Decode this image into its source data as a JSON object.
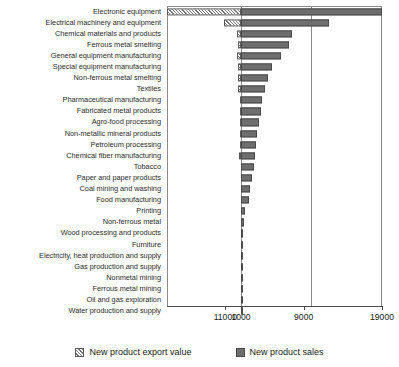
{
  "chart_data": {
    "type": "bar",
    "orientation": "horizontal",
    "title": "",
    "xlabel": "",
    "ylabel": "",
    "grid": true,
    "legend_position": "bottom",
    "axis_ticks": [
      {
        "label": "11000",
        "value": -1000
      },
      {
        "label": "1000",
        "value": 1000
      },
      {
        "label": "9000",
        "value": 9000
      },
      {
        "label": "19000",
        "value": 19000
      }
    ],
    "xlim": [
      -1000,
      19000
    ],
    "baseline_value": 1000,
    "categories": [
      "Electronic equipment",
      "Electrical machinery and equipment",
      "Chemical materials and products",
      "Ferrous metal smelting",
      "General equipment manufacturing",
      "Special equipment manufacturing",
      "Non-ferrous metal smelting",
      "Textiles",
      "Pharmaceutical manufacturing",
      "Fabricated metal products",
      "Agro-food processing",
      "Non-metallic mineral products",
      "Petroleum processing",
      "Chemical fiber manufacturing",
      "Tobacco",
      "Paper and paper products",
      "Coal mining and washing",
      "Food manufacturing",
      "Printing",
      "Non-ferrous metal",
      "Wood processing and products",
      "Furniture",
      "Electricity, heat production and supply",
      "Gas production and supply",
      "Nonmetal mining",
      "Ferrous metal mining",
      "Oil and gas exploration",
      "Water production and supply"
    ],
    "series": [
      {
        "name": "New product sales",
        "key": "sales",
        "color": "#6e6e6e",
        "pattern": "solid",
        "values": [
          19000,
          12200,
          7500,
          7150,
          6100,
          4950,
          4450,
          4000,
          3700,
          3550,
          3300,
          3050,
          2950,
          2800,
          2600,
          2350,
          2150,
          2050,
          1450,
          1330,
          1300,
          1290,
          1240,
          1220,
          1190,
          1170,
          1150,
          1130
        ]
      },
      {
        "name": "New product export value",
        "key": "export",
        "color": "#ffffff",
        "pattern": "diagonal-hatch",
        "values": [
          -11000,
          -2200,
          -480,
          -350,
          -460,
          -430,
          -350,
          -320,
          -180,
          -150,
          -120,
          -110,
          -100,
          -260,
          -60,
          -40,
          -30,
          -25,
          -20,
          -15,
          -12,
          -10,
          -8,
          -6,
          -5,
          -4,
          -3,
          -2
        ]
      }
    ],
    "legend_entries": [
      {
        "label": "New product export value",
        "pattern": "diagonal-hatch"
      },
      {
        "label": "New product sales",
        "pattern": "solid"
      }
    ]
  }
}
